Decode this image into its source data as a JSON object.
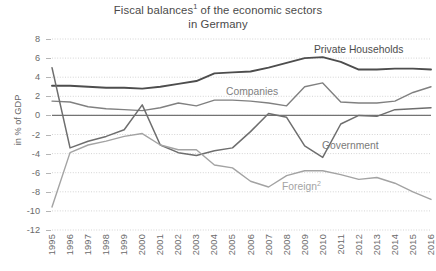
{
  "chart_data": {
    "type": "line",
    "title_line1": "Fiscal balances",
    "title_line1_sup": "1",
    "title_line1_rest": " of the economic sectors",
    "title_line2": "in Germany",
    "xlabel": "",
    "ylabel": "in % of GDP",
    "ylim": [
      -12,
      8
    ],
    "ytick_step": 2,
    "grid": true,
    "legend_position": "inline-annotations",
    "x": [
      "1995",
      "1996",
      "1997",
      "1998",
      "1999",
      "2000",
      "2001",
      "2002",
      "2003",
      "2004",
      "2005",
      "2006",
      "2007",
      "2008",
      "2009",
      "2010",
      "2011",
      "2012",
      "2013",
      "2014",
      "2015",
      "2016"
    ],
    "yticks": [
      "8",
      "6",
      "4",
      "2",
      "0",
      "-2",
      "-4",
      "-6",
      "-8",
      "-10",
      "-12"
    ],
    "series": [
      {
        "name": "Private Households",
        "color": "#4d4d4d",
        "width": 1.9,
        "values": [
          3.1,
          3.1,
          3.0,
          2.9,
          2.9,
          2.8,
          3.0,
          3.3,
          3.6,
          4.4,
          4.5,
          4.6,
          5.0,
          5.5,
          6.0,
          6.1,
          5.6,
          4.8,
          4.8,
          4.9,
          4.9,
          4.8
        ]
      },
      {
        "name": "Companies",
        "color": "#808080",
        "width": 1.4,
        "values": [
          1.5,
          1.4,
          0.9,
          0.7,
          0.6,
          0.5,
          0.8,
          1.3,
          1.0,
          1.6,
          1.6,
          1.5,
          1.3,
          1.0,
          3.0,
          3.4,
          1.4,
          1.3,
          1.3,
          1.5,
          2.4,
          3.0
        ]
      },
      {
        "name": "Government",
        "color": "#6e6e6e",
        "width": 1.5,
        "values": [
          5.0,
          -3.4,
          -2.7,
          -2.2,
          -1.5,
          1.1,
          -3.1,
          -3.9,
          -4.2,
          -3.7,
          -3.4,
          -1.7,
          0.2,
          -0.2,
          -3.2,
          -4.4,
          -0.9,
          0.0,
          -0.1,
          0.6,
          0.7,
          0.8
        ]
      },
      {
        "name": "Foreign²",
        "color": "#a3a3a3",
        "width": 1.4,
        "values": [
          -9.6,
          -3.9,
          -3.1,
          -2.7,
          -2.2,
          -1.9,
          -3.1,
          -3.6,
          -3.6,
          -5.2,
          -5.5,
          -6.9,
          -7.5,
          -6.3,
          -5.8,
          -5.8,
          -6.2,
          -6.7,
          -6.5,
          -7.1,
          -8.0,
          -8.8
        ]
      }
    ],
    "annotations": [
      {
        "name": "Private Households",
        "text": "Private Households"
      },
      {
        "name": "Companies",
        "text": "Companies"
      },
      {
        "name": "Government",
        "text": "Government"
      },
      {
        "name": "Foreign",
        "text": "Foreign",
        "sup": "2"
      }
    ]
  }
}
